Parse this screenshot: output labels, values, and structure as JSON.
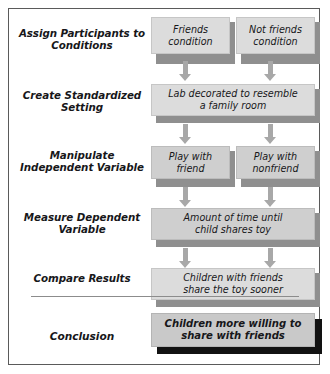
{
  "diagram": {
    "border_color": "#5a5a5a",
    "box_fill": "#d3d3d3",
    "shadow_color": "#8f8f8f",
    "conclusion_shadow_color": "#121212",
    "arrow_color": "#a8a8a8",
    "divider_color": "#8c8c8c"
  },
  "stages": [
    {
      "id": "assign",
      "label_line1": "Assign Participants",
      "label_line2": "to Conditions"
    },
    {
      "id": "setting",
      "label_line1": "Create Standardized",
      "label_line2": "Setting"
    },
    {
      "id": "manipulate",
      "label_line1": "Manipulate",
      "label_line2": "Independent Variable"
    },
    {
      "id": "measure",
      "label_line1": "Measure",
      "label_line2": "Dependent Variable"
    },
    {
      "id": "compare",
      "label_line1": "Compare",
      "label_line2": "Results"
    },
    {
      "id": "conclusion",
      "label_line1": "Conclusion",
      "label_line2": ""
    }
  ],
  "boxes": {
    "friends_condition": {
      "line1": "Friends",
      "line2": "condition"
    },
    "not_friends_condition": {
      "line1": "Not friends",
      "line2": "condition"
    },
    "lab_setting": {
      "line1": "Lab decorated to resemble",
      "line2": "a family room"
    },
    "play_friend": {
      "line1": "Play with",
      "line2": "friend"
    },
    "play_nonfriend": {
      "line1": "Play with",
      "line2": "nonfriend"
    },
    "measure_time": {
      "line1": "Amount of time until",
      "line2": "child shares toy"
    },
    "compare_result": {
      "line1": "Children with friends",
      "line2": "share the toy sooner"
    },
    "conclusion_box": {
      "line1": "Children more willing to",
      "line2": "share with friends"
    }
  },
  "arrows": [
    {
      "id": "arrow-friends-to-lab",
      "from": "friends_condition",
      "to": "lab_setting"
    },
    {
      "id": "arrow-notfriends-to-lab",
      "from": "not_friends_condition",
      "to": "lab_setting"
    },
    {
      "id": "arrow-lab-to-playfriend",
      "from": "lab_setting",
      "to": "play_friend"
    },
    {
      "id": "arrow-lab-to-playnonfriend",
      "from": "lab_setting",
      "to": "play_nonfriend"
    },
    {
      "id": "arrow-playfriend-to-measure",
      "from": "play_friend",
      "to": "measure_time"
    },
    {
      "id": "arrow-playnonfriend-to-measure",
      "from": "play_nonfriend",
      "to": "measure_time"
    },
    {
      "id": "arrow-measure-to-compare-left",
      "from": "measure_time",
      "to": "compare_result"
    },
    {
      "id": "arrow-measure-to-compare-right",
      "from": "measure_time",
      "to": "compare_result"
    }
  ]
}
